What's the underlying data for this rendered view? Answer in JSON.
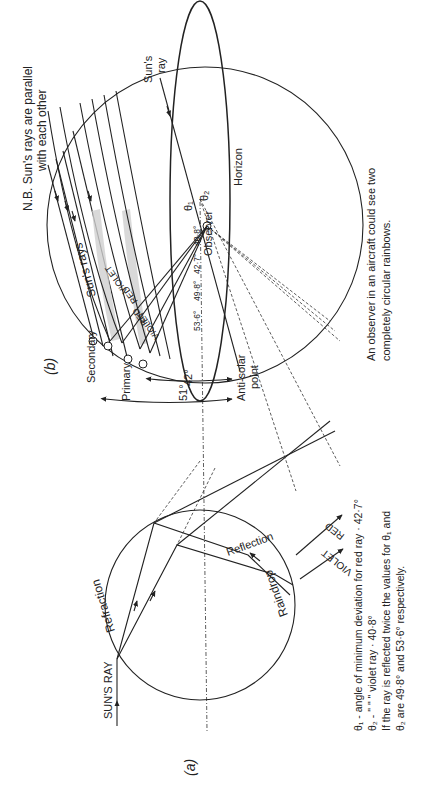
{
  "figure_b": {
    "label": "(b)",
    "note_line1": "N.B. Sun's rays are parallel",
    "note_line2": "with each other",
    "suns_ray_line1": "Sun's",
    "suns_ray_line2": "ray",
    "suns_rays": "Sun's rays",
    "horizon": "Horizon",
    "observer": "Observer",
    "violet_top": "VIOLET",
    "red_top": "RED",
    "red_bottom": "RED",
    "violet_bottom": "VIOLET",
    "angles": [
      "40·8°",
      "42·7°",
      "49·8°",
      "53·6°"
    ],
    "secondary": "Secondary",
    "primary": "Primary",
    "angle_42": "42°",
    "angle_51": "51°",
    "anti_solar_line1": "Anti-solar",
    "anti_solar_line2": "point",
    "caption_line1": "An observer in an aircraft could see two",
    "caption_line2": "completely circular rainbows."
  },
  "figure_a": {
    "label": "(a)",
    "suns_ray": "SUN'S RAY",
    "refraction": "Refraction",
    "reflection": "Reflection",
    "raindrop": "Raindrop",
    "violet": "VIOLET",
    "red": "RED",
    "theta1": "θ₁",
    "theta2": "θ₂",
    "legend_line1": "θ₁ - angle of minimum deviation for red ray · 42·7°",
    "legend_line2": "θ₂ -      \"              \"            \"   violet ray · 40·8°",
    "legend_line3": "If the ray is reflected twice the values for θ₁ and",
    "legend_line4": "θ₂ are 49·8° and 53·6° respectively."
  }
}
